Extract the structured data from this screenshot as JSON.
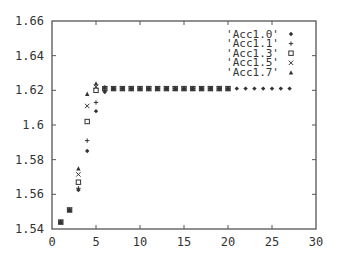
{
  "chart_data": {
    "type": "scatter",
    "title": "",
    "xlabel": "",
    "ylabel": "",
    "xlim": [
      0,
      30
    ],
    "ylim": [
      1.54,
      1.66
    ],
    "x_ticks": [
      0,
      5,
      10,
      15,
      20,
      25,
      30
    ],
    "y_ticks": [
      1.54,
      1.56,
      1.58,
      1.6,
      1.62,
      1.64,
      1.66
    ],
    "y_tick_labels": [
      "1.54",
      "1.56",
      "1.58",
      "1.6",
      "1.62",
      "1.64",
      "1.66"
    ],
    "grid": false,
    "legend_position": "upper right",
    "series": [
      {
        "name": "'Acc1.0'",
        "marker": "diamond",
        "x": [
          1,
          2,
          3,
          4,
          5,
          6,
          7,
          8,
          9,
          10,
          11,
          12,
          13,
          14,
          15,
          16,
          17,
          18,
          19,
          20,
          21,
          22,
          23,
          24,
          25,
          26,
          27
        ],
        "y": [
          1.544,
          1.551,
          1.5625,
          1.585,
          1.608,
          1.619,
          1.621,
          1.621,
          1.621,
          1.621,
          1.621,
          1.621,
          1.621,
          1.621,
          1.621,
          1.621,
          1.621,
          1.621,
          1.621,
          1.621,
          1.621,
          1.621,
          1.621,
          1.621,
          1.621,
          1.621,
          1.621
        ]
      },
      {
        "name": "'Acc1.1'",
        "marker": "plus",
        "x": [
          1,
          2,
          3,
          4,
          5,
          6,
          7,
          8,
          9,
          10,
          11,
          12,
          13,
          14,
          15,
          16,
          17,
          18,
          19,
          20
        ],
        "y": [
          1.544,
          1.551,
          1.5635,
          1.591,
          1.613,
          1.62,
          1.621,
          1.621,
          1.621,
          1.621,
          1.621,
          1.621,
          1.621,
          1.621,
          1.621,
          1.621,
          1.621,
          1.621,
          1.621,
          1.621
        ]
      },
      {
        "name": "'Acc1.3'",
        "marker": "square",
        "x": [
          1,
          2,
          3,
          4,
          5,
          6,
          7,
          8,
          9,
          10,
          11,
          12,
          13,
          14,
          15,
          16,
          17,
          18,
          19,
          20
        ],
        "y": [
          1.544,
          1.551,
          1.567,
          1.602,
          1.62,
          1.621,
          1.621,
          1.621,
          1.621,
          1.621,
          1.621,
          1.621,
          1.621,
          1.621,
          1.621,
          1.621,
          1.621,
          1.621,
          1.621,
          1.621
        ]
      },
      {
        "name": "'Acc1.5'",
        "marker": "cross",
        "x": [
          1,
          2,
          3,
          4,
          5,
          6,
          7,
          8,
          9,
          10,
          11,
          12,
          13,
          14,
          15,
          16,
          17,
          18,
          19,
          20
        ],
        "y": [
          1.544,
          1.551,
          1.5715,
          1.611,
          1.622,
          1.621,
          1.621,
          1.621,
          1.621,
          1.621,
          1.621,
          1.621,
          1.621,
          1.621,
          1.621,
          1.621,
          1.621,
          1.621,
          1.621,
          1.621
        ]
      },
      {
        "name": "'Acc1.7'",
        "marker": "triangle",
        "x": [
          1,
          2,
          3,
          4,
          5,
          6,
          7,
          8,
          9,
          10,
          11,
          12,
          13,
          14,
          15,
          16,
          17,
          18,
          19,
          20
        ],
        "y": [
          1.544,
          1.551,
          1.575,
          1.618,
          1.624,
          1.622,
          1.621,
          1.621,
          1.621,
          1.621,
          1.621,
          1.621,
          1.621,
          1.621,
          1.621,
          1.621,
          1.621,
          1.621,
          1.621,
          1.621
        ]
      }
    ]
  },
  "colors": {
    "axis": "#555555",
    "marker": "#333333",
    "background": "#ffffff"
  }
}
